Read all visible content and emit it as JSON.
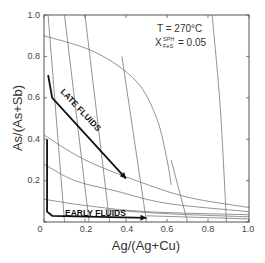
{
  "chart_data": {
    "type": "line",
    "title": "",
    "xlabel": "Ag/(Ag+Cu)",
    "ylabel": "As/(As+Sb)",
    "xlim": [
      0,
      1.0
    ],
    "ylim": [
      0,
      1.0
    ],
    "x_ticks": [
      "0",
      "0.2",
      "0.4",
      "0.6",
      "0.8",
      "1.0"
    ],
    "y_ticks": [
      "0.2",
      "0.4",
      "0.6",
      "0.8",
      "1.0"
    ],
    "grid": false,
    "annotations": {
      "temperature": "T = 270°C",
      "x_symbol": "X",
      "x_superscript": "SPH",
      "x_subscript": "FeS",
      "x_value": "= 0.05"
    },
    "series": [
      {
        "name": "LATE FLUIDS",
        "style": "thick-arrow",
        "points": [
          [
            0.02,
            0.71
          ],
          [
            0.04,
            0.6
          ],
          [
            0.4,
            0.21
          ]
        ]
      },
      {
        "name": "EARLY FLUIDS",
        "style": "thick-arrow",
        "points": [
          [
            0.015,
            0.4
          ],
          [
            0.015,
            0.05
          ],
          [
            0.04,
            0.03
          ],
          [
            0.5,
            0.02
          ]
        ]
      }
    ],
    "contours": {
      "near_vertical": [
        [
          [
            0.02,
            1.0
          ],
          [
            0.1,
            0.0
          ]
        ],
        [
          [
            0.1,
            1.0
          ],
          [
            0.22,
            0.0
          ]
        ],
        [
          [
            0.2,
            1.0
          ],
          [
            0.32,
            0.0
          ]
        ],
        [
          [
            0.38,
            0.8
          ],
          [
            0.5,
            0.0
          ]
        ],
        [
          [
            0.62,
            0.3
          ],
          [
            0.7,
            0.0
          ]
        ],
        [
          [
            0.82,
            1.0
          ],
          [
            0.86,
            0.55
          ],
          [
            0.89,
            0.0
          ]
        ]
      ],
      "hyperbolic": [
        [
          [
            0.0,
            0.9
          ],
          [
            0.25,
            0.82
          ],
          [
            0.45,
            0.68
          ],
          [
            0.55,
            0.5
          ],
          [
            0.6,
            0.3
          ],
          [
            0.62,
            0.18
          ]
        ],
        [
          [
            0.0,
            0.42
          ],
          [
            0.2,
            0.3
          ],
          [
            0.45,
            0.2
          ],
          [
            0.7,
            0.12
          ],
          [
            1.0,
            0.07
          ]
        ],
        [
          [
            0.0,
            0.28
          ],
          [
            0.15,
            0.2
          ],
          [
            0.35,
            0.15
          ],
          [
            0.6,
            0.09
          ],
          [
            1.0,
            0.05
          ]
        ],
        [
          [
            0.0,
            0.11
          ],
          [
            0.2,
            0.08
          ],
          [
            0.5,
            0.05
          ],
          [
            1.0,
            0.035
          ]
        ],
        [
          [
            0.3,
            0.06
          ],
          [
            0.6,
            0.04
          ],
          [
            1.0,
            0.025
          ]
        ],
        [
          [
            0.5,
            0.03
          ],
          [
            1.0,
            0.015
          ]
        ]
      ]
    }
  }
}
